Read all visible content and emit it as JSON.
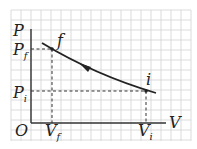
{
  "diagram": {
    "type": "pv-diagram",
    "axes": {
      "y_label": "P",
      "x_label": "V",
      "origin_label": "O"
    },
    "points": [
      {
        "name": "f",
        "label": "f",
        "p_label": "P",
        "p_sub": "f",
        "v_label": "V",
        "v_sub": "f"
      },
      {
        "name": "i",
        "label": "i",
        "p_label": "P",
        "p_sub": "i",
        "v_label": "V",
        "v_sub": "i"
      }
    ],
    "process": {
      "from": "i",
      "to": "f",
      "direction_arrow": "toward f"
    },
    "colors": {
      "grid": "#cfcfcf",
      "ink": "#222222",
      "background": "#ffffff"
    }
  }
}
